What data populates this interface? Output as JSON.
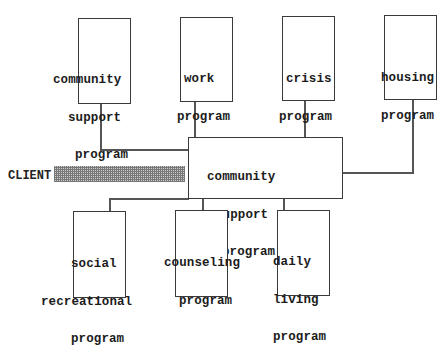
{
  "diagram": {
    "type": "hub-and-spoke",
    "center": {
      "id": "center",
      "lines": [
        "community",
        "support",
        "program"
      ]
    },
    "client": {
      "label": "CLIENT"
    },
    "top_nodes": [
      {
        "id": "community-support",
        "lines": [
          "community",
          "support",
          "program"
        ]
      },
      {
        "id": "work",
        "lines": [
          "work",
          "program"
        ]
      },
      {
        "id": "crisis",
        "lines": [
          "crisis",
          "program"
        ]
      },
      {
        "id": "housing",
        "lines": [
          "housing",
          "program"
        ]
      }
    ],
    "bottom_nodes": [
      {
        "id": "social-recreational",
        "lines": [
          "social",
          "recreational",
          "program"
        ]
      },
      {
        "id": "counseling",
        "lines": [
          "counseling",
          "program"
        ]
      },
      {
        "id": "daily-living",
        "lines": [
          "daily",
          "living",
          "program"
        ]
      }
    ],
    "edges": [
      [
        "center",
        "community-support"
      ],
      [
        "center",
        "work"
      ],
      [
        "center",
        "crisis"
      ],
      [
        "center",
        "housing"
      ],
      [
        "center",
        "social-recreational"
      ],
      [
        "center",
        "counseling"
      ],
      [
        "center",
        "daily-living"
      ],
      [
        "client",
        "center"
      ]
    ]
  }
}
